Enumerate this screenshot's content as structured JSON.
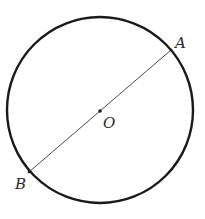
{
  "diagram": {
    "type": "circle-with-diameter",
    "circle": {
      "cx": 100,
      "cy": 110,
      "r": 93,
      "stroke": "#1a1a1a",
      "stroke_width": 2.4
    },
    "diameter": {
      "x1": 171,
      "y1": 50,
      "x2": 29,
      "y2": 172,
      "stroke": "#333333",
      "stroke_width": 0.9
    },
    "center_dot": {
      "cx": 100,
      "cy": 111,
      "r": 1.8
    },
    "labels": {
      "A": "A",
      "B": "B",
      "O": "O"
    },
    "label_positions": {
      "A": {
        "x": 175,
        "y": 48
      },
      "B": {
        "x": 15,
        "y": 189
      },
      "O": {
        "x": 103,
        "y": 128
      }
    }
  }
}
